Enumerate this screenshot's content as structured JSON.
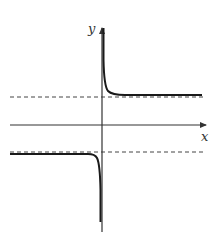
{
  "diagram": {
    "type": "function-graph",
    "axes": {
      "x_label": "x",
      "y_label": "y"
    },
    "asymptotes": {
      "vertical": "y-axis (x = 0)",
      "horizontal_upper": "dashed line above x-axis",
      "horizontal_lower": "dashed line below x-axis"
    },
    "curve_branches": [
      {
        "name": "right-branch",
        "behavior": "descends from +infinity near y-axis and approaches the upper dashed asymptote"
      },
      {
        "name": "left-branch",
        "behavior": "follows the lower dashed asymptote and drops to -infinity near y-axis"
      }
    ],
    "colors": {
      "curve": "#1a1a1a",
      "axes": "#333333",
      "dashed": "#444444"
    }
  }
}
